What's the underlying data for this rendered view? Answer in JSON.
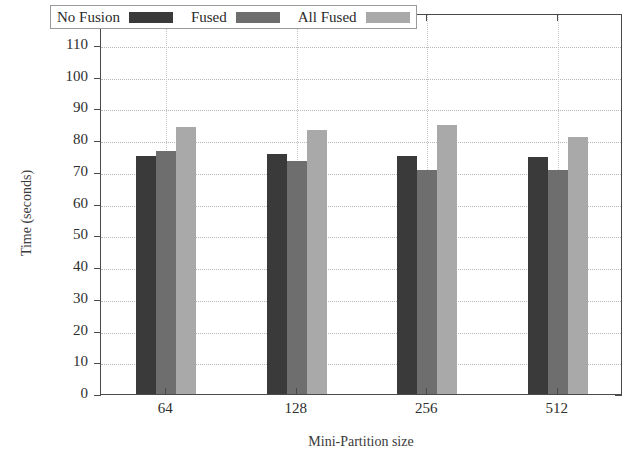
{
  "chart_data": {
    "type": "bar",
    "title": "",
    "subtitle": "",
    "xlabel": "Mini-Partition size",
    "ylabel": "Time (seconds)",
    "categories": [
      "64",
      "128",
      "256",
      "512"
    ],
    "series": [
      {
        "name": "No Fusion",
        "color": "#3a3a3a",
        "values": [
          75,
          75.5,
          75,
          74.5
        ]
      },
      {
        "name": "Fused",
        "color": "#6e6e6e",
        "values": [
          76.5,
          73.5,
          70.5,
          70.5
        ]
      },
      {
        "name": "All Fused",
        "color": "#a9a9a9",
        "values": [
          84,
          83,
          84.8,
          81
        ]
      }
    ],
    "ylim": [
      0,
      120
    ],
    "ytick_labels": [
      "0",
      "10",
      "20",
      "30",
      "40",
      "50",
      "60",
      "70",
      "80",
      "90",
      "100",
      "110",
      "120"
    ],
    "ytick_values": [
      0,
      10,
      20,
      30,
      40,
      50,
      60,
      70,
      80,
      90,
      100,
      110,
      120
    ],
    "ytick_step": 10,
    "grid": true,
    "grid_axis": "y",
    "legend_position": "top-inside",
    "legend_entries": [
      "No Fusion",
      "Fused",
      "All Fused"
    ],
    "background_color": "#ffffff",
    "axis_color": "#4a4a4a"
  }
}
